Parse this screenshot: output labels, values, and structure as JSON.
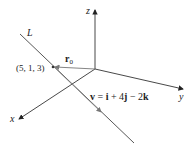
{
  "diagram": {
    "type": "3d-line-vector-equation",
    "axes": {
      "z_label": "z",
      "y_label": "y",
      "x_label": "x"
    },
    "line": {
      "label": "L"
    },
    "point": {
      "label": "(5, 1, 3)"
    },
    "position_vector": {
      "label": "r",
      "subscript": "0"
    },
    "direction_vector": {
      "label": "v = i + 4j − 2k",
      "parts": {
        "v": "v",
        "eq": " = ",
        "i": "i",
        "plus": " + 4",
        "j": "j",
        "minus": " − 2",
        "k": "k"
      }
    },
    "colors": {
      "axis": "#333333",
      "line": "#444444",
      "vector": "#555555"
    }
  }
}
